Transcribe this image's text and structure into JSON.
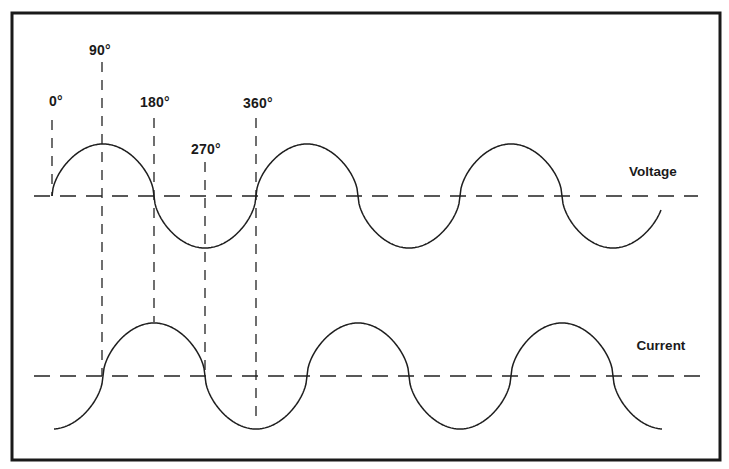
{
  "diagram": {
    "title": "",
    "frame": {
      "x": 12,
      "y": 13,
      "width": 708,
      "height": 447,
      "color": "#1a1a1a"
    },
    "angle_labels": [
      {
        "text": "0°",
        "x": 56,
        "y": 101
      },
      {
        "text": "90°",
        "x": 100,
        "y": 50
      },
      {
        "text": "180°",
        "x": 155,
        "y": 102
      },
      {
        "text": "270°",
        "x": 206,
        "y": 149
      },
      {
        "text": "360°",
        "x": 258,
        "y": 103
      }
    ],
    "series": [
      {
        "name": "Voltage",
        "label_x": 653,
        "label_y": 171,
        "axis_y": 196,
        "axis_x_start": 34,
        "axis_x_end": 698,
        "start_x": 52,
        "end_x": 661,
        "period_px": 204,
        "amplitude_px": 52,
        "phase_deg": 0
      },
      {
        "name": "Current",
        "label_x": 661,
        "label_y": 345,
        "axis_y": 376,
        "axis_x_start": 34,
        "axis_x_end": 704,
        "start_x": 54,
        "end_x": 662,
        "period_px": 204,
        "amplitude_px": 53,
        "phase_deg": -90
      }
    ],
    "guides": [
      {
        "angle": "0°",
        "x": 52,
        "y1": 120,
        "y2": 196
      },
      {
        "angle": "90°",
        "x": 102,
        "y1": 62,
        "y2": 376
      },
      {
        "angle": "180°",
        "x": 154,
        "y1": 118,
        "y2": 322
      },
      {
        "angle": "270°",
        "x": 205,
        "y1": 162,
        "y2": 376
      },
      {
        "angle": "360°",
        "x": 256,
        "y1": 118,
        "y2": 424
      }
    ],
    "caption": "Current lags voltage by 90°"
  }
}
